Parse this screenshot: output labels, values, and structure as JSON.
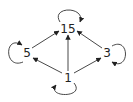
{
  "diagram": {
    "type": "directed-graph",
    "colors": {
      "edge": "#333333",
      "label": "#222222",
      "background": "#ffffff"
    },
    "nodes": [
      {
        "id": "n15",
        "label": "15",
        "x": 68,
        "y": 29
      },
      {
        "id": "n5",
        "label": "5",
        "x": 27,
        "y": 53
      },
      {
        "id": "n3",
        "label": "3",
        "x": 107,
        "y": 53
      },
      {
        "id": "n1",
        "label": "1",
        "x": 68,
        "y": 78
      }
    ],
    "edges": [
      {
        "from": "1",
        "to": "5"
      },
      {
        "from": "1",
        "to": "3"
      },
      {
        "from": "1",
        "to": "15"
      },
      {
        "from": "5",
        "to": "15"
      },
      {
        "from": "3",
        "to": "15"
      },
      {
        "from": "15",
        "to": "15",
        "loop": "top"
      },
      {
        "from": "5",
        "to": "5",
        "loop": "left"
      },
      {
        "from": "3",
        "to": "3",
        "loop": "right"
      },
      {
        "from": "1",
        "to": "1",
        "loop": "bottom"
      }
    ]
  }
}
